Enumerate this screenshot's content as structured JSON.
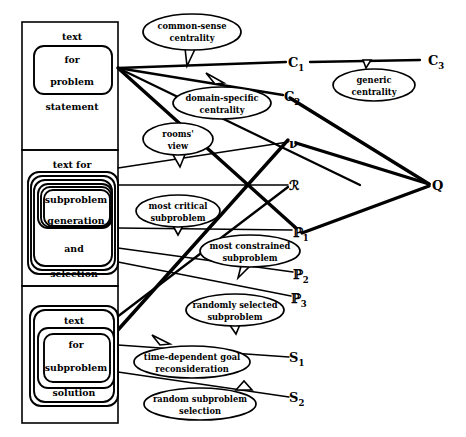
{
  "diagram": {
    "title": "",
    "background_color": "#ffffff",
    "line_color": "#000000"
  },
  "panels": [
    {
      "id": "problem-statement",
      "lines": [
        "text",
        "for",
        "problem",
        "statement"
      ],
      "outer_label_top": "text",
      "inner_label_1": "for",
      "inner_label_2": "problem",
      "outer_label_bottom": "statement"
    },
    {
      "id": "subproblem-generation",
      "outer_label_top": "text for",
      "inner_label_1": "subproblem",
      "inner_label_2": "generation",
      "mid_label": "and",
      "outer_label_bottom": "selection"
    },
    {
      "id": "subproblem-solution",
      "outer_label_top": "text",
      "inner_label_1": "for",
      "inner_label_2": "subproblem",
      "outer_label_bottom": "solution"
    }
  ],
  "bubbles": [
    {
      "id": "common-sense-centrality",
      "line1": "common-sense",
      "line2": "centrality"
    },
    {
      "id": "domain-specific-centrality",
      "line1": "domain-specific",
      "line2": "centrality"
    },
    {
      "id": "rooms-view",
      "line1": "rooms'",
      "line2": "view"
    },
    {
      "id": "generic-centrality",
      "line1": "generic",
      "line2": "centrality"
    },
    {
      "id": "most-critical-subproblem",
      "line1": "most critical",
      "line2": "subproblem"
    },
    {
      "id": "most-constrained-subproblem",
      "line1": "most constrained",
      "line2": "subproblem"
    },
    {
      "id": "randomly-selected-subproblem",
      "line1": "randomly selected",
      "line2": "subproblem"
    },
    {
      "id": "time-dependent-goal-reconsideration",
      "line1": "time-dependent goal",
      "line2": "reconsideration"
    },
    {
      "id": "random-subproblem-selection",
      "line1": "random subproblem",
      "line2": "selection"
    }
  ],
  "nodes": [
    {
      "id": "C1",
      "base": "C",
      "sub": "1"
    },
    {
      "id": "C2",
      "base": "C",
      "sub": "2"
    },
    {
      "id": "C3",
      "base": "C",
      "sub": "3"
    },
    {
      "id": "nu",
      "base": "ν",
      "sub": ""
    },
    {
      "id": "R",
      "base": "ℛ",
      "sub": ""
    },
    {
      "id": "P1",
      "base": "ℙ",
      "sub": "1"
    },
    {
      "id": "P2",
      "base": "ℙ",
      "sub": "2"
    },
    {
      "id": "P3",
      "base": "ℙ",
      "sub": "3"
    },
    {
      "id": "S1",
      "base": "S",
      "sub": "1"
    },
    {
      "id": "S2",
      "base": "S",
      "sub": "2"
    },
    {
      "id": "Q",
      "base": "Q",
      "sub": ""
    }
  ]
}
